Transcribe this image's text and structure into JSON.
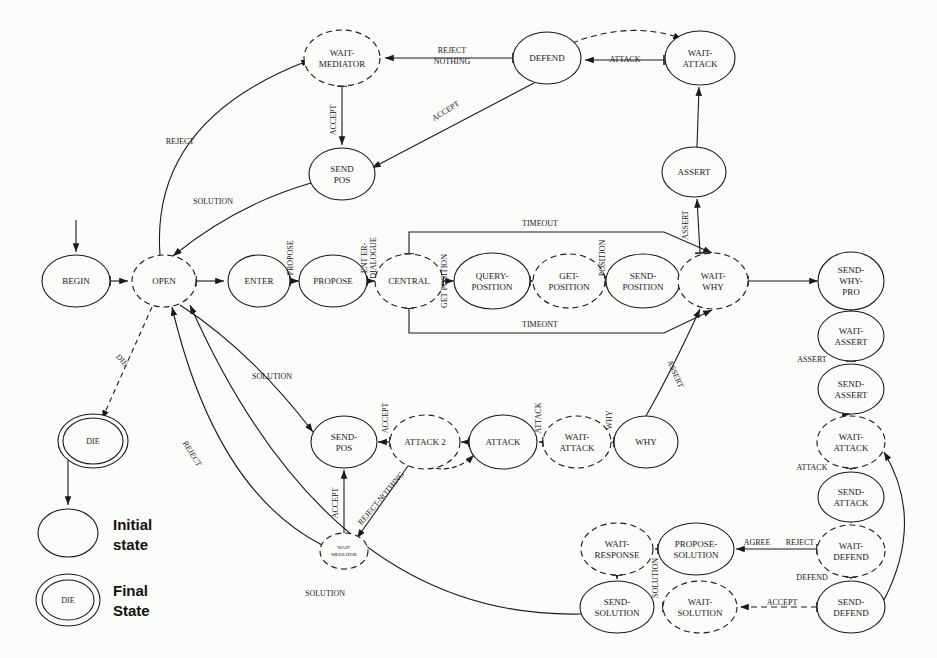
{
  "diagram": {
    "background_color": "#fbfbfa",
    "stroke_color": "#1a1a1a",
    "legend": {
      "initial_label_line1": "Initial",
      "initial_label_line2": "state",
      "final_label_line1": "Final",
      "final_label_line2": "State",
      "final_node_label": "DIE"
    },
    "nodes": [
      {
        "id": "begin",
        "label": "BEGIN",
        "x": 76,
        "y": 281,
        "rx": 34,
        "ry": 26,
        "style": "solid",
        "lines": [
          "BEGIN"
        ],
        "fs": 9
      },
      {
        "id": "open",
        "label": "OPEN",
        "x": 164,
        "y": 281,
        "rx": 32,
        "ry": 26,
        "style": "dashed",
        "lines": [
          "OPEN"
        ],
        "fs": 9
      },
      {
        "id": "enter",
        "label": "ENTER",
        "x": 259,
        "y": 281,
        "rx": 31,
        "ry": 26,
        "style": "solid",
        "lines": [
          "ENTER"
        ],
        "fs": 9
      },
      {
        "id": "propose",
        "label": "PROPOSE",
        "x": 333,
        "y": 281,
        "rx": 34,
        "ry": 26,
        "style": "solid",
        "lines": [
          "PROPOSE"
        ],
        "fs": 9
      },
      {
        "id": "central",
        "label": "CENTRAL",
        "x": 409,
        "y": 281,
        "rx": 34,
        "ry": 27,
        "style": "dashed",
        "lines": [
          "CENTRAL"
        ],
        "fs": 9
      },
      {
        "id": "query-position",
        "label": "QUERY-POSITION",
        "x": 492,
        "y": 281,
        "rx": 38,
        "ry": 28,
        "style": "solid",
        "lines": [
          "QUERY-",
          "POSITION"
        ],
        "fs": 9
      },
      {
        "id": "get-position",
        "label": "GET-POSITION",
        "x": 569,
        "y": 281,
        "rx": 36,
        "ry": 27,
        "style": "dashed",
        "lines": [
          "GET-",
          "POSITION"
        ],
        "fs": 9
      },
      {
        "id": "send-position",
        "label": "SEND-POSITION",
        "x": 643,
        "y": 281,
        "rx": 37,
        "ry": 27,
        "style": "solid",
        "lines": [
          "SEND-",
          "POSITION"
        ],
        "fs": 9
      },
      {
        "id": "wait-why",
        "label": "WAIT-WHY",
        "x": 713,
        "y": 281,
        "rx": 35,
        "ry": 28,
        "style": "dashed",
        "lines": [
          "WAIT-",
          "WHY"
        ],
        "fs": 9
      },
      {
        "id": "send-why-pro",
        "label": "SEND-WHY-PRO",
        "x": 851,
        "y": 281,
        "rx": 33,
        "ry": 29,
        "style": "solid",
        "lines": [
          "SEND-",
          "WHY-",
          "PRO"
        ],
        "fs": 9
      },
      {
        "id": "wait-mediator-top",
        "label": "WAIT-MEDIATOR",
        "x": 342,
        "y": 58,
        "rx": 38,
        "ry": 28,
        "style": "dashed",
        "lines": [
          "WAIT-",
          "MEDIATOR"
        ],
        "fs": 9
      },
      {
        "id": "defend",
        "label": "DEFEND",
        "x": 547,
        "y": 58,
        "rx": 34,
        "ry": 26,
        "style": "solid",
        "lines": [
          "DEFEND"
        ],
        "fs": 9
      },
      {
        "id": "wait-attack-top",
        "label": "WAIT-ATTACK",
        "x": 700,
        "y": 58,
        "rx": 35,
        "ry": 27,
        "style": "solid",
        "lines": [
          "WAIT-",
          "ATTACK"
        ],
        "fs": 9
      },
      {
        "id": "assert",
        "label": "ASSERT",
        "x": 694,
        "y": 172,
        "rx": 32,
        "ry": 25,
        "style": "solid",
        "lines": [
          "ASSERT"
        ],
        "fs": 9
      },
      {
        "id": "send-pos-top",
        "label": "SEND-POS",
        "x": 342,
        "y": 174,
        "rx": 33,
        "ry": 26,
        "style": "solid",
        "lines": [
          "SEND",
          "POS"
        ],
        "fs": 9
      },
      {
        "id": "wait-assert",
        "label": "WAIT-ASSERT",
        "x": 851,
        "y": 336,
        "rx": 33,
        "ry": 25,
        "style": "solid",
        "lines": [
          "WAIT-",
          "ASSERT"
        ],
        "fs": 9
      },
      {
        "id": "send-assert",
        "label": "SEND-ASSERT",
        "x": 851,
        "y": 389,
        "rx": 33,
        "ry": 25,
        "style": "solid",
        "lines": [
          "SEND-",
          "ASSERT"
        ],
        "fs": 9
      },
      {
        "id": "wait-attack-r",
        "label": "WAIT-ATTACK",
        "x": 851,
        "y": 442,
        "rx": 34,
        "ry": 26,
        "style": "dashed",
        "lines": [
          "WAIT-",
          "ATTACK"
        ],
        "fs": 9
      },
      {
        "id": "send-attack",
        "label": "SEND-ATTACK",
        "x": 851,
        "y": 497,
        "rx": 33,
        "ry": 25,
        "style": "solid",
        "lines": [
          "SEND-",
          "ATTACK"
        ],
        "fs": 9
      },
      {
        "id": "wait-defend",
        "label": "WAIT-DEFEND",
        "x": 851,
        "y": 551,
        "rx": 34,
        "ry": 26,
        "style": "dashed",
        "lines": [
          "WAIT-",
          "DEFEND"
        ],
        "fs": 9
      },
      {
        "id": "send-defend",
        "label": "SEND-DEFEND",
        "x": 851,
        "y": 607,
        "rx": 34,
        "ry": 26,
        "style": "solid",
        "lines": [
          "SEND-",
          "DEFEND"
        ],
        "fs": 9
      },
      {
        "id": "send-pos-mid",
        "label": "SEND-POS",
        "x": 344,
        "y": 442,
        "rx": 33,
        "ry": 26,
        "style": "solid",
        "lines": [
          "SEND-",
          "POS"
        ],
        "fs": 9
      },
      {
        "id": "attack-2",
        "label": "ATTACK 2",
        "x": 425,
        "y": 442,
        "rx": 35,
        "ry": 27,
        "style": "dashed",
        "lines": [
          "ATTACK  2"
        ],
        "fs": 9
      },
      {
        "id": "attack",
        "label": "ATTACK",
        "x": 503,
        "y": 442,
        "rx": 34,
        "ry": 27,
        "style": "solid",
        "lines": [
          "ATTACK"
        ],
        "fs": 9
      },
      {
        "id": "wait-attack-m",
        "label": "WAIT-ATTACK",
        "x": 577,
        "y": 442,
        "rx": 34,
        "ry": 26,
        "style": "dashed",
        "lines": [
          "WAIT-",
          "ATTACK"
        ],
        "fs": 9
      },
      {
        "id": "why",
        "label": "WHY",
        "x": 646,
        "y": 442,
        "rx": 32,
        "ry": 26,
        "style": "solid",
        "lines": [
          "WHY"
        ],
        "fs": 9
      },
      {
        "id": "wait-mediator-low",
        "label": "WAIT-MEDIATOR",
        "x": 344,
        "y": 551,
        "rx": 24,
        "ry": 18,
        "style": "dashed",
        "lines": [
          "WAIT-",
          "MEDIATOR"
        ],
        "fs": 5
      },
      {
        "id": "wait-response",
        "label": "WAIT-RESPONSE",
        "x": 617,
        "y": 549,
        "rx": 36,
        "ry": 26,
        "style": "dashed",
        "lines": [
          "WAIT-",
          "RESPONSE"
        ],
        "fs": 9
      },
      {
        "id": "propose-solution",
        "label": "PROPOSE-SOLUTION",
        "x": 696,
        "y": 549,
        "rx": 38,
        "ry": 26,
        "style": "solid",
        "lines": [
          "PROPOSE-",
          "SOLUTION"
        ],
        "fs": 9
      },
      {
        "id": "send-solution",
        "label": "SEND-SOLUTION",
        "x": 617,
        "y": 607,
        "rx": 37,
        "ry": 26,
        "style": "solid",
        "lines": [
          "SEND-",
          "SOLUTION"
        ],
        "fs": 9
      },
      {
        "id": "wait-solution",
        "label": "WAIT-SOLUTION",
        "x": 700,
        "y": 607,
        "rx": 37,
        "ry": 26,
        "style": "dashed",
        "lines": [
          "WAIT-",
          "SOLUTION"
        ],
        "fs": 9
      },
      {
        "id": "die",
        "label": "DIE",
        "x": 93,
        "y": 441,
        "rx": 30,
        "ry": 23,
        "style": "final",
        "lines": [
          "DIE"
        ],
        "fs": 8
      }
    ],
    "edge_labels": [
      {
        "id": "l-reject-nothing",
        "text_line1": "REJECT",
        "text_line2": "NOTHING",
        "x": 452,
        "y": 53,
        "rot": 0
      },
      {
        "id": "l-attack-top",
        "text": "ATTACK",
        "x": 625,
        "y": 62,
        "rot": 0
      },
      {
        "id": "l-accept-vert",
        "text": "ACCEPT",
        "x": 336,
        "y": 120,
        "rot": -90
      },
      {
        "id": "l-accept-diag",
        "text": "ACCEPT",
        "x": 447,
        "y": 113,
        "rot": -32
      },
      {
        "id": "l-assert-vert",
        "text": "ASSERT",
        "x": 688,
        "y": 225,
        "rot": -90
      },
      {
        "id": "l-reject-top",
        "text": "REJECT",
        "x": 180,
        "y": 144,
        "rot": 0
      },
      {
        "id": "l-solution-top",
        "text": "SOLUTION",
        "x": 213,
        "y": 204,
        "rot": 0
      },
      {
        "id": "l-propose",
        "text": "PROPOSE",
        "x": 293,
        "y": 258,
        "rot": -90
      },
      {
        "id": "l-enter-dialogue-1",
        "text": "ENT ER-",
        "x": 367,
        "y": 258,
        "rot": -90
      },
      {
        "id": "l-enter-dialogue-2",
        "text": "DIALOGUE",
        "x": 376,
        "y": 258,
        "rot": -90
      },
      {
        "id": "l-get-position",
        "text": "GET  POSITION",
        "x": 447,
        "y": 281,
        "rot": -90
      },
      {
        "id": "l-position",
        "text": "POSITION",
        "x": 605,
        "y": 258,
        "rot": -90
      },
      {
        "id": "l-timeout-top",
        "text": "TIMEOUT",
        "x": 540,
        "y": 226,
        "rot": 0
      },
      {
        "id": "l-timeout-bottom",
        "text": "TIMEONT",
        "x": 540,
        "y": 327,
        "rot": 0
      },
      {
        "id": "l-assert-right",
        "text": "ASSERT",
        "x": 812,
        "y": 362,
        "rot": 0
      },
      {
        "id": "l-attack-right",
        "text": "ATTACK",
        "x": 812,
        "y": 470,
        "rot": 0
      },
      {
        "id": "l-defend-right",
        "text": "DEFEND",
        "x": 812,
        "y": 580,
        "rot": 0
      },
      {
        "id": "l-agree",
        "text": "AGREE",
        "x": 757,
        "y": 545,
        "rot": 0
      },
      {
        "id": "l-reject-right",
        "text": "REJECT",
        "x": 800,
        "y": 545,
        "rot": 0
      },
      {
        "id": "l-accept-dash",
        "text": "ACCEPT",
        "x": 782,
        "y": 605,
        "rot": 0
      },
      {
        "id": "l-solution-vert",
        "text": "SOLUTION",
        "x": 658,
        "y": 578,
        "rot": -90
      },
      {
        "id": "l-die",
        "text": "DIE",
        "x": 120,
        "y": 362,
        "rot": 48
      },
      {
        "id": "l-solution-mid",
        "text": "SOLUTION",
        "x": 272,
        "y": 379,
        "rot": 0
      },
      {
        "id": "l-reject-mid",
        "text": "REJECT",
        "x": 190,
        "y": 455,
        "rot": 58
      },
      {
        "id": "l-accept-mid",
        "text": "ACCEPT",
        "x": 338,
        "y": 503,
        "rot": -90
      },
      {
        "id": "l-reject-nothing-mid",
        "text": "REJECT-NOTHING",
        "x": 383,
        "y": 500,
        "rot": -50
      },
      {
        "id": "l-accept-a2",
        "text": "ACCEPT",
        "x": 388,
        "y": 418,
        "rot": -90
      },
      {
        "id": "l-attack-mid",
        "text": "ATTACK",
        "x": 541,
        "y": 418,
        "rot": -90
      },
      {
        "id": "l-why",
        "text": "WHY",
        "x": 612,
        "y": 420,
        "rot": -90
      },
      {
        "id": "l-assert-curve",
        "text": "ASSERT",
        "x": 673,
        "y": 375,
        "rot": 66
      },
      {
        "id": "l-solution-bottom",
        "text": "SOLUTION",
        "x": 325,
        "y": 596,
        "rot": 0
      }
    ]
  }
}
